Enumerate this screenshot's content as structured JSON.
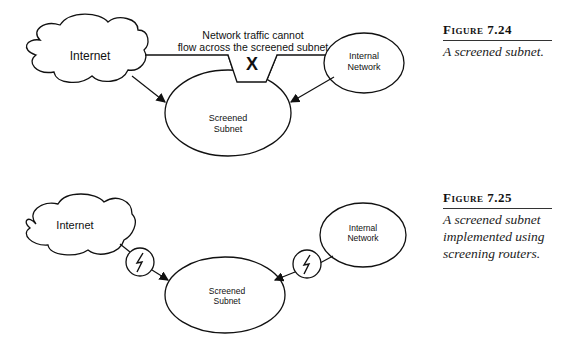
{
  "figures": [
    {
      "caption_title": "Figure 7.24",
      "caption_text": "A screened subnet.",
      "nodes": {
        "internet": "Internet",
        "internal_network_line1": "Internal",
        "internal_network_line2": "Network",
        "screened_subnet_line1": "Screened",
        "screened_subnet_line2": "Subnet"
      },
      "annotation_line1": "Network traffic cannot",
      "annotation_line2": "flow across the screened subnet",
      "blocked_mark": "X"
    },
    {
      "caption_title": "Figure 7.25",
      "caption_text_line1": "A screened subnet",
      "caption_text_line2": "implemented using",
      "caption_text_line3": "screening routers.",
      "nodes": {
        "internet": "Internet",
        "internal_network_line1": "Internal",
        "internal_network_line2": "Network",
        "screened_subnet_line1": "Screened",
        "screened_subnet_line2": "Subnet"
      },
      "router_icon": "lightning-bolt-icon"
    }
  ]
}
